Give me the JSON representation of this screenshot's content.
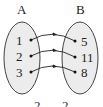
{
  "diagram": {
    "type": "set-mapping",
    "sets": [
      {
        "name": "A",
        "elements": [
          "1",
          "2",
          "3"
        ]
      },
      {
        "name": "B",
        "elements": [
          "5",
          "11",
          "8"
        ]
      }
    ],
    "mappings": [
      {
        "from": "1",
        "to": "5"
      },
      {
        "from": "2",
        "to": "11"
      },
      {
        "from": "3",
        "to": "8"
      }
    ],
    "colors": {
      "ellipse_fill": "#ececec",
      "stroke": "#333333"
    },
    "bottom_partial_text": [
      "2",
      "2"
    ]
  }
}
